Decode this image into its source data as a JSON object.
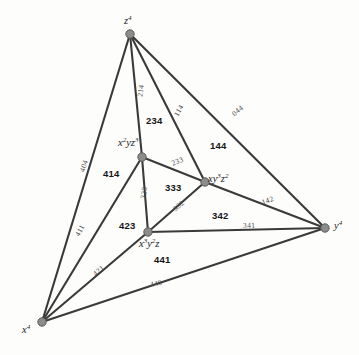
{
  "figure": {
    "background_color": "#fdfdfc",
    "edge_color": "#3a3a3a",
    "node_color": "#8c8c8c"
  },
  "vertices": [
    {
      "id": "z4",
      "label_html": "z<sup>4</sup>",
      "label_text": "z^4",
      "x": 130,
      "y": 34,
      "label_x": 124,
      "label_y": 16
    },
    {
      "id": "x2yz3",
      "label_html": "x<sup>2</sup>yz<sup>3</sup>",
      "label_text": "x^2 y z^3",
      "x": 142,
      "y": 157,
      "label_x": 118,
      "label_y": 138
    },
    {
      "id": "xy3z2",
      "label_html": "xy<sup>3</sup>z<sup>2</sup>",
      "label_text": "xy^3 z^2",
      "x": 205,
      "y": 182,
      "label_x": 208,
      "label_y": 174
    },
    {
      "id": "x3y2z",
      "label_html": "x<sup>3</sup>y<sup>2</sup>z",
      "label_text": "x^3 y^2 z",
      "x": 148,
      "y": 232,
      "label_x": 139,
      "label_y": 239
    },
    {
      "id": "y4",
      "label_html": "y<sup>4</sup>",
      "label_text": "y^4",
      "x": 325,
      "y": 228,
      "label_x": 334,
      "label_y": 221
    },
    {
      "id": "x4",
      "label_html": "x<sup>4</sup>",
      "label_text": "x^4",
      "x": 42,
      "y": 322,
      "label_x": 22,
      "label_y": 325
    }
  ],
  "edges": [
    {
      "id": "e-z4-x2yz3",
      "from": "z4",
      "to": "x2yz3",
      "label": "214",
      "label_x": 140,
      "label_y": 93,
      "rotation": -83
    },
    {
      "id": "e-z4-xy3z2",
      "from": "z4",
      "to": "xy3z2",
      "label": "114",
      "label_x": 176,
      "label_y": 112,
      "rotation": -60
    },
    {
      "id": "e-z4-y4",
      "from": "z4",
      "to": "y4",
      "label": "044",
      "label_x": 233,
      "label_y": 111,
      "rotation": -40
    },
    {
      "id": "e-z4-x4",
      "from": "z4",
      "to": "x4",
      "label": "404",
      "label_x": 82,
      "label_y": 168,
      "rotation": -72
    },
    {
      "id": "e-x2yz3-xy3z2",
      "from": "x2yz3",
      "to": "xy3z2",
      "label": "233",
      "label_x": 172,
      "label_y": 160,
      "rotation": -22
    },
    {
      "id": "e-x2yz3-x3y2z",
      "from": "x2yz3",
      "to": "x3y2z",
      "label": "323",
      "label_x": 143,
      "label_y": 195,
      "rotation": -80
    },
    {
      "id": "e-x2yz3-x4",
      "from": "x2yz3",
      "to": "x4",
      "label": "411",
      "label_x": 77,
      "label_y": 232,
      "rotation": -60
    },
    {
      "id": "e-xy3z2-x3y2z",
      "from": "xy3z2",
      "to": "x3y2z",
      "label": "332",
      "label_x": 174,
      "label_y": 206,
      "rotation": -40
    },
    {
      "id": "e-xy3z2-y4",
      "from": "xy3z2",
      "to": "y4",
      "label": "142",
      "label_x": 262,
      "label_y": 199,
      "rotation": -20
    },
    {
      "id": "e-x3y2z-y4",
      "from": "x3y2z",
      "to": "y4",
      "label": "341",
      "label_x": 243,
      "label_y": 222,
      "rotation": -2
    },
    {
      "id": "e-x3y2z-x4",
      "from": "x3y2z",
      "to": "x4",
      "label": "421",
      "label_x": 94,
      "label_y": 271,
      "rotation": -40
    },
    {
      "id": "e-x4-y4",
      "from": "x4",
      "to": "y4",
      "label": "440",
      "label_x": 150,
      "label_y": 281,
      "rotation": -11
    }
  ],
  "faces": [
    {
      "id": "f-234",
      "label": "234",
      "x": 146,
      "y": 116
    },
    {
      "id": "f-144",
      "label": "144",
      "x": 210,
      "y": 141
    },
    {
      "id": "f-414",
      "label": "414",
      "x": 103,
      "y": 169
    },
    {
      "id": "f-333",
      "label": "333",
      "x": 165,
      "y": 183
    },
    {
      "id": "f-342",
      "label": "342",
      "x": 212,
      "y": 211
    },
    {
      "id": "f-423",
      "label": "423",
      "x": 119,
      "y": 221
    },
    {
      "id": "f-441",
      "label": "441",
      "x": 154,
      "y": 255
    }
  ]
}
